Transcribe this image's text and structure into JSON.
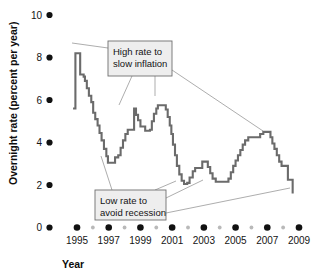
{
  "chart_data": {
    "type": "line",
    "title": "",
    "subtitle": "",
    "xlabel": "Year",
    "ylabel": "Overnight rate (percent per year)",
    "xlim": [
      1994.6,
      2009.4
    ],
    "ylim": [
      0,
      10
    ],
    "grid": false,
    "legend": null,
    "step_style": "step-post",
    "x_ticks_major": [
      1995,
      1997,
      1999,
      2001,
      2003,
      2005,
      2007,
      2009
    ],
    "x_ticks_minor": [
      1996,
      1998,
      2000,
      2002,
      2004,
      2006,
      2008
    ],
    "y_ticks": [
      0,
      2,
      4,
      6,
      8,
      10
    ],
    "series": [
      {
        "name": "Overnight rate",
        "color": "#6b6b6b",
        "points": [
          {
            "x": 1994.75,
            "y": 5.6
          },
          {
            "x": 1994.9,
            "y": 8.2
          },
          {
            "x": 1995.15,
            "y": 8.2
          },
          {
            "x": 1995.2,
            "y": 7.2
          },
          {
            "x": 1995.42,
            "y": 7.1
          },
          {
            "x": 1995.5,
            "y": 6.9
          },
          {
            "x": 1995.62,
            "y": 6.55
          },
          {
            "x": 1995.75,
            "y": 6.2
          },
          {
            "x": 1995.9,
            "y": 5.9
          },
          {
            "x": 1996.02,
            "y": 5.4
          },
          {
            "x": 1996.15,
            "y": 5.1
          },
          {
            "x": 1996.3,
            "y": 4.8
          },
          {
            "x": 1996.42,
            "y": 4.45
          },
          {
            "x": 1996.55,
            "y": 4.1
          },
          {
            "x": 1996.7,
            "y": 3.7
          },
          {
            "x": 1996.85,
            "y": 3.35
          },
          {
            "x": 1996.95,
            "y": 3.05
          },
          {
            "x": 1997.3,
            "y": 3.05
          },
          {
            "x": 1997.4,
            "y": 3.3
          },
          {
            "x": 1997.6,
            "y": 3.4
          },
          {
            "x": 1997.75,
            "y": 3.75
          },
          {
            "x": 1997.9,
            "y": 4.1
          },
          {
            "x": 1998.05,
            "y": 4.4
          },
          {
            "x": 1998.2,
            "y": 4.6
          },
          {
            "x": 1998.5,
            "y": 4.6
          },
          {
            "x": 1998.6,
            "y": 5.6
          },
          {
            "x": 1998.72,
            "y": 5.3
          },
          {
            "x": 1998.85,
            "y": 5.05
          },
          {
            "x": 1999.0,
            "y": 4.75
          },
          {
            "x": 1999.3,
            "y": 4.55
          },
          {
            "x": 1999.6,
            "y": 4.6
          },
          {
            "x": 1999.72,
            "y": 5.0
          },
          {
            "x": 1999.85,
            "y": 5.35
          },
          {
            "x": 2000.0,
            "y": 5.6
          },
          {
            "x": 2000.1,
            "y": 5.75
          },
          {
            "x": 2000.45,
            "y": 5.75
          },
          {
            "x": 2000.6,
            "y": 5.55
          },
          {
            "x": 2000.72,
            "y": 5.2
          },
          {
            "x": 2000.85,
            "y": 4.8
          },
          {
            "x": 2000.95,
            "y": 4.4
          },
          {
            "x": 2001.05,
            "y": 3.9
          },
          {
            "x": 2001.18,
            "y": 3.4
          },
          {
            "x": 2001.3,
            "y": 2.9
          },
          {
            "x": 2001.45,
            "y": 2.5
          },
          {
            "x": 2001.6,
            "y": 2.2
          },
          {
            "x": 2001.75,
            "y": 2.05
          },
          {
            "x": 2001.95,
            "y": 2.1
          },
          {
            "x": 2002.1,
            "y": 2.35
          },
          {
            "x": 2002.3,
            "y": 2.65
          },
          {
            "x": 2002.45,
            "y": 2.8
          },
          {
            "x": 2002.75,
            "y": 2.8
          },
          {
            "x": 2002.9,
            "y": 3.1
          },
          {
            "x": 2003.1,
            "y": 3.1
          },
          {
            "x": 2003.25,
            "y": 2.85
          },
          {
            "x": 2003.4,
            "y": 2.55
          },
          {
            "x": 2003.55,
            "y": 2.3
          },
          {
            "x": 2003.75,
            "y": 2.15
          },
          {
            "x": 2004.4,
            "y": 2.15
          },
          {
            "x": 2004.55,
            "y": 2.3
          },
          {
            "x": 2004.7,
            "y": 2.6
          },
          {
            "x": 2004.85,
            "y": 2.9
          },
          {
            "x": 2005.0,
            "y": 3.15
          },
          {
            "x": 2005.15,
            "y": 3.4
          },
          {
            "x": 2005.3,
            "y": 3.65
          },
          {
            "x": 2005.45,
            "y": 3.9
          },
          {
            "x": 2005.6,
            "y": 4.1
          },
          {
            "x": 2005.8,
            "y": 4.25
          },
          {
            "x": 2006.4,
            "y": 4.25
          },
          {
            "x": 2006.55,
            "y": 4.4
          },
          {
            "x": 2006.75,
            "y": 4.5
          },
          {
            "x": 2007.05,
            "y": 4.5
          },
          {
            "x": 2007.2,
            "y": 4.25
          },
          {
            "x": 2007.32,
            "y": 3.95
          },
          {
            "x": 2007.45,
            "y": 3.7
          },
          {
            "x": 2007.6,
            "y": 3.4
          },
          {
            "x": 2007.75,
            "y": 3.1
          },
          {
            "x": 2007.9,
            "y": 2.9
          },
          {
            "x": 2008.15,
            "y": 2.9
          },
          {
            "x": 2008.3,
            "y": 2.25
          },
          {
            "x": 2008.5,
            "y": 2.25
          },
          {
            "x": 2008.6,
            "y": 1.6
          }
        ]
      }
    ],
    "annotations": [
      {
        "id": "high-rate",
        "lines": [
          "High rate to",
          "slow inflation"
        ],
        "box": {
          "x": 108,
          "y": 41,
          "w": 64,
          "h": 35
        },
        "leaders": [
          {
            "from": [
              108,
              48
            ],
            "to": [
              72,
              43
            ]
          },
          {
            "from": [
              132,
              76
            ],
            "to": [
              119,
              105
            ]
          },
          {
            "from": [
              155,
              76
            ],
            "to": [
              155,
              96
            ]
          },
          {
            "from": [
              172,
              70
            ],
            "to": [
              263,
              131
            ]
          }
        ]
      },
      {
        "id": "low-rate",
        "lines": [
          "Low rate to",
          "avoid recession"
        ],
        "box": {
          "x": 95,
          "y": 190,
          "w": 71,
          "h": 30
        },
        "leaders": [
          {
            "from": [
              112,
              190
            ],
            "to": [
              101,
              156
            ]
          },
          {
            "from": [
              155,
              190
            ],
            "to": [
              176,
              181
            ]
          },
          {
            "from": [
              166,
              198
            ],
            "to": [
              203,
              180
            ]
          },
          {
            "from": [
              166,
              213
            ],
            "to": [
              290,
              188
            ]
          }
        ]
      }
    ]
  },
  "axis": {
    "y_labels": [
      "10",
      "8",
      "6",
      "4",
      "2",
      "0"
    ],
    "x_labels": [
      "1995",
      "1997",
      "1999",
      "2001",
      "2003",
      "2005",
      "2007",
      "2009"
    ],
    "y_title": "Overnight rate (percent per year)",
    "x_title": "Year"
  },
  "annotation_text": {
    "high_line1": "High rate to",
    "high_line2": "slow inflation",
    "low_line1": "Low rate to",
    "low_line2": "avoid recession"
  },
  "colors": {
    "line": "#6b6b6b",
    "major_dot": "#111111",
    "minor_dot": "#b9b9b9",
    "callout_fill": "#eeeeee",
    "callout_stroke": "#6f6f6f",
    "leader": "#8a8a8a",
    "background": "#ffffff"
  }
}
